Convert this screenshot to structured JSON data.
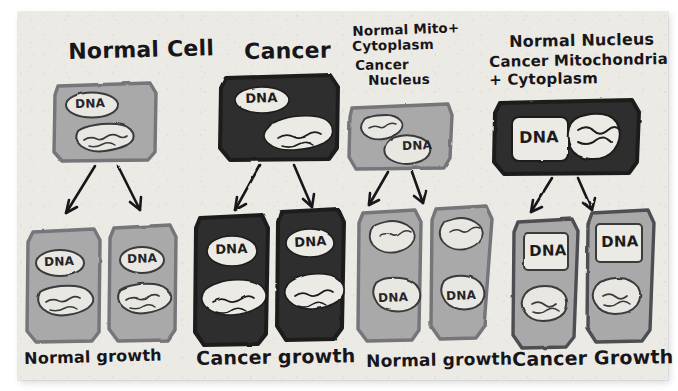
{
  "figure": {
    "type": "hand-drawn scientific diagram",
    "medium": "marker sketch on paper",
    "topic": "Nuclear and mitochondrial transfer experiment: effect of nucleus vs mitochondria/cytoplasm origin on cell growth",
    "paper_color": "#eceae4",
    "ink_color": "#17161a",
    "normal_cell_fill": "#a9a9a9",
    "normal_cell_outline": "#6f6f72",
    "cancer_cell_fill": "#2f2d2d",
    "organelle_fill": "#e8e6e1",
    "columns": 4,
    "rows": 2
  },
  "columns": [
    {
      "id": "normal-cell",
      "header": {
        "lines": [
          "Normal Cell"
        ]
      },
      "parent": {
        "cell_type": "normal",
        "fill": "#a9a9a9",
        "nucleus_label": "DNA",
        "nucleus_shape": "oval",
        "nucleus_fill": "light",
        "mitochondria": "normal",
        "mitochondria_count": 1
      },
      "arrows": 2,
      "daughters": [
        {
          "cell_type": "normal",
          "fill": "#a9a9a9",
          "nucleus_label": "DNA",
          "nucleus_shape": "oval",
          "mitochondria": "normal"
        },
        {
          "cell_type": "normal",
          "fill": "#a9a9a9",
          "nucleus_label": "DNA",
          "nucleus_shape": "oval",
          "mitochondria": "normal"
        }
      ],
      "outcome": "Normal growth"
    },
    {
      "id": "cancer-cell",
      "header": {
        "lines": [
          "Cancer"
        ]
      },
      "parent": {
        "cell_type": "cancer",
        "fill": "#2f2d2d",
        "nucleus_label": "DNA",
        "nucleus_shape": "oval",
        "nucleus_fill": "white",
        "mitochondria": "cancer",
        "mitochondria_count": 1
      },
      "arrows": 2,
      "daughters": [
        {
          "cell_type": "cancer",
          "fill": "#2f2d2d",
          "nucleus_label": "DNA",
          "nucleus_shape": "oval",
          "mitochondria": "cancer"
        },
        {
          "cell_type": "cancer",
          "fill": "#2f2d2d",
          "nucleus_label": "DNA",
          "nucleus_shape": "oval",
          "mitochondria": "cancer"
        }
      ],
      "outcome": "Cancer growth"
    },
    {
      "id": "normal-mito-cancer-nucleus",
      "header": {
        "lines": [
          "Normal Mito+",
          "Cytoplasm",
          "Cancer",
          "  Nucleus"
        ]
      },
      "parent": {
        "cell_type": "hybrid",
        "fill": "#a9a9a9",
        "nucleus_label": "DNA",
        "nucleus_shape": "blob",
        "nucleus_position": "bottom-right",
        "mitochondria": "normal",
        "mitochondria_position": "top-left"
      },
      "arrows": 2,
      "daughters": [
        {
          "cell_type": "hybrid",
          "fill": "#a9a9a9",
          "nucleus_label": "DNA",
          "nucleus_shape": "blob",
          "mitochondria": "normal"
        },
        {
          "cell_type": "hybrid",
          "fill": "#a9a9a9",
          "nucleus_label": "DNA",
          "nucleus_shape": "blob",
          "mitochondria": "normal"
        }
      ],
      "outcome": "Normal growth"
    },
    {
      "id": "normal-nucleus-cancer-mito",
      "header": {
        "lines": [
          "Normal Nucleus",
          "Cancer Mitochondria",
          "+ Cytoplasm"
        ]
      },
      "parent": {
        "cell_type": "hybrid",
        "fill": "#2f2d2d",
        "nucleus_label": "DNA",
        "nucleus_shape": "rounded-square",
        "nucleus_position": "left",
        "mitochondria": "cancer",
        "mitochondria_position": "right"
      },
      "arrows": 2,
      "daughters": [
        {
          "cell_type": "hybrid",
          "fill": "#a9a9a9",
          "nucleus_label": "DNA",
          "nucleus_shape": "rounded-square",
          "mitochondria": "cancer"
        },
        {
          "cell_type": "hybrid",
          "fill": "#a9a9a9",
          "nucleus_label": "DNA",
          "nucleus_shape": "rounded-square",
          "mitochondria": "cancer"
        }
      ],
      "outcome": "Cancer Growth"
    }
  ],
  "labels": {
    "header_1": "Normal Cell",
    "header_2": "Cancer",
    "header_3_line1": "Normal Mito+",
    "header_3_line2": "Cytoplasm",
    "header_3_line3": "Cancer",
    "header_3_line4": "Nucleus",
    "header_4_line1": "Normal Nucleus",
    "header_4_line2": "Cancer Mitochondria",
    "header_4_line3": "+ Cytoplasm",
    "outcome_1": "Normal growth",
    "outcome_2": "Cancer growth",
    "outcome_3": "Normal growth",
    "outcome_4": "Cancer Growth",
    "dna_1": "DNA",
    "dna_2": "DNA",
    "dna_3": "DNA",
    "dna_4": "DNA",
    "dna_5": "DNA",
    "dna_6": "DNA",
    "dna_7": "DNA",
    "dna_8": "DNA",
    "dna_9": "DNA",
    "dna_10": "DNA",
    "dna_11": "DNA",
    "dna_12": "DNA"
  }
}
